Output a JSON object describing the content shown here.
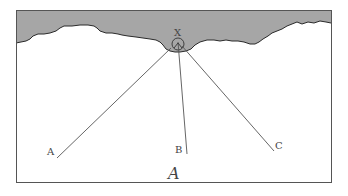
{
  "figure": {
    "panel_label": "A",
    "apex_label": "X",
    "ray_labels": [
      "A",
      "B",
      "C"
    ],
    "colors": {
      "surface_fill": "#a6a6a6",
      "surface_edge": "#2a2a2a",
      "frame": "#555555",
      "ray": "#555555",
      "background": "#ffffff"
    },
    "frame": {
      "x": 16,
      "y": 10,
      "width": 315,
      "height": 172
    },
    "apex": {
      "x": 178,
      "y": 42
    },
    "rays": [
      {
        "label": "A",
        "x1": 171,
        "y1": 48,
        "x2": 57,
        "y2": 158,
        "label_x": 48,
        "label_y": 154
      },
      {
        "label": "B",
        "x1": 178,
        "y1": 43,
        "x2": 187,
        "y2": 154,
        "label_x": 176,
        "label_y": 152
      },
      {
        "label": "C",
        "x1": 183,
        "y1": 47,
        "x2": 274,
        "y2": 151,
        "label_x": 275,
        "label_y": 148
      }
    ]
  }
}
